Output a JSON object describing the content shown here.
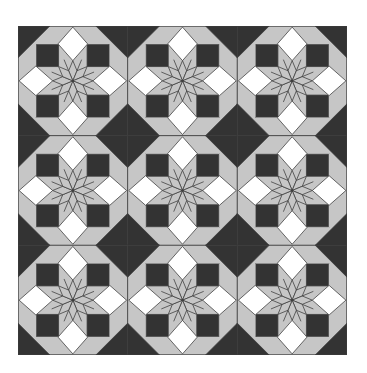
{
  "image": {
    "subject": "eight-point star quilt pattern",
    "grid": {
      "rows": 3,
      "cols": 3
    }
  },
  "colors": {
    "background": "#ffffff",
    "dark": "#333333",
    "light_gray": "#c6c6c6",
    "white": "#ffffff",
    "outline": "#3c3c3c"
  }
}
